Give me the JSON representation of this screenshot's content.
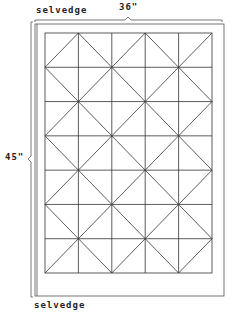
{
  "diagram": {
    "labels": {
      "selvedge_top": "selvedge",
      "width": "36\"",
      "height": "45\"",
      "selvedge_bottom": "selvedge"
    },
    "grid": {
      "columns": 5,
      "rows": 7
    },
    "colors": {
      "line": "#333333",
      "border": "#555555",
      "background": "#ffffff"
    }
  }
}
